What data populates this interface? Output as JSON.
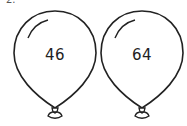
{
  "header": {
    "label": "2."
  },
  "balloons": [
    {
      "number": "46"
    },
    {
      "number": "64"
    }
  ]
}
